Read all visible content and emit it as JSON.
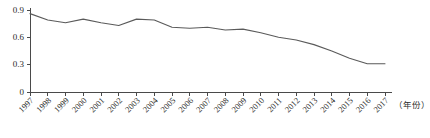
{
  "chart_data": {
    "type": "line",
    "title": "",
    "subtitle": "",
    "xlabel": "（年份）",
    "ylabel": "",
    "xlim": [
      1997,
      2017
    ],
    "ylim": [
      0,
      0.9
    ],
    "grid": false,
    "legend": null,
    "y_ticks": [
      "0",
      "0.3",
      "0.6",
      "0.9"
    ],
    "y_tick_values": [
      0,
      0.3,
      0.6,
      0.9
    ],
    "categories": [
      "1997",
      "1998",
      "1999",
      "2000",
      "2001",
      "2002",
      "2003",
      "2004",
      "2005",
      "2006",
      "2007",
      "2008",
      "2009",
      "2010",
      "2011",
      "2012",
      "2013",
      "2014",
      "2015",
      "2016",
      "2017"
    ],
    "x": [
      1997,
      1998,
      1999,
      2000,
      2001,
      2002,
      2003,
      2004,
      2005,
      2006,
      2007,
      2008,
      2009,
      2010,
      2011,
      2012,
      2013,
      2014,
      2015,
      2016,
      2017
    ],
    "values": [
      0.86,
      0.79,
      0.76,
      0.8,
      0.76,
      0.73,
      0.8,
      0.79,
      0.71,
      0.7,
      0.71,
      0.68,
      0.69,
      0.65,
      0.6,
      0.57,
      0.52,
      0.45,
      0.37,
      0.31,
      0.31
    ],
    "series": [
      {
        "name": "series-1",
        "color": "#5a5a5a",
        "values": [
          0.86,
          0.79,
          0.76,
          0.8,
          0.76,
          0.73,
          0.8,
          0.79,
          0.71,
          0.7,
          0.71,
          0.68,
          0.69,
          0.65,
          0.6,
          0.57,
          0.52,
          0.45,
          0.37,
          0.31,
          0.31
        ]
      }
    ],
    "axis_color": "#4a4a4a",
    "line_color": "#5a5a5a",
    "background": "#ffffff"
  }
}
